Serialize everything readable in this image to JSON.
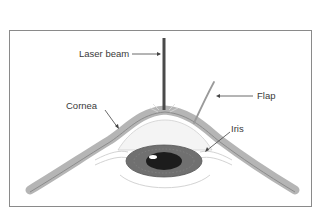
{
  "diagram": {
    "labels": {
      "laser_beam": "Laser beam",
      "flap": "Flap",
      "cornea": "Cornea",
      "iris": "Iris"
    },
    "colors": {
      "frame_border": "#8a8a8a",
      "cornea": "#a9a9a9",
      "iris": "#6f6f6f",
      "pupil": "#1a1a1a",
      "laser": "#4a4a4a",
      "text": "#3a3a3a"
    }
  }
}
